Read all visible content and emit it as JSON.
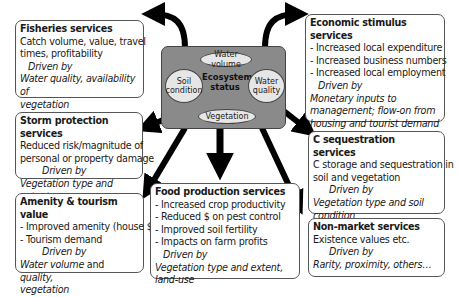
{
  "center": {
    "label_line1": "Ecosystem",
    "label_line2": "status",
    "components": {
      "water_volume": "Water volume",
      "soil_line1": "Soil",
      "soil_line2": "condition",
      "water_quality_line1": "Water",
      "water_quality_line2": "quality",
      "vegetation": "Vegetation"
    },
    "fill_color": "#8a8a8a",
    "ellipse_color": "#e6e6e6"
  },
  "services": {
    "fisheries": {
      "title": "Fisheries services",
      "lines": [
        "Catch volume, value, travel",
        "times, profitability"
      ],
      "driven_by": "Driven by",
      "drivers": [
        "Water quality, availability of",
        "vegetation"
      ]
    },
    "storm": {
      "title": "Storm protection services",
      "lines": [
        "Reduced risk/magnitude of",
        "personal or property damage"
      ],
      "driven_by": "Driven by",
      "drivers": [
        "Vegetation type and extent"
      ]
    },
    "amenity": {
      "title": "Amenity & tourism value",
      "lines": [
        "- Improved amenity (house $)",
        "- Tourism demand"
      ],
      "driven_by": "Driven by",
      "drivers_a": "Water volume",
      "drivers_and": " and ",
      "drivers_b": "quality,",
      "drivers_line2": "vegetation"
    },
    "food": {
      "title": "Food production services",
      "lines": [
        "- Increased crop productivity",
        "- Reduced $ on pest control",
        "- Improved soil fertility",
        "- Impacts on farm profits"
      ],
      "driven_by": "Driven by",
      "drivers": [
        "Vegetation type and extent, land-use"
      ]
    },
    "economic": {
      "title": "Economic stimulus services",
      "lines": [
        "- Increased local expenditure",
        "- Increased business numbers",
        "- Increased local employment"
      ],
      "driven_by": "Driven by",
      "drivers": [
        "Monetary inputs to",
        "management; flow-on from",
        "housing and tourist demand"
      ]
    },
    "carbon": {
      "title": "C sequestration services",
      "lines": [
        "C storage and sequestration in",
        "soil and vegetation"
      ],
      "driven_by": "Driven by",
      "drivers": [
        "Vegetation type and soil",
        "condition"
      ]
    },
    "nonmarket": {
      "title": "Non-market services",
      "lines": [
        "Existence values etc."
      ],
      "driven_by": "Driven by",
      "drivers": [
        "Rarity, proximity, others…"
      ]
    }
  },
  "arrows": [
    {
      "from": "Ecosystem status",
      "to": "Fisheries services"
    },
    {
      "from": "Ecosystem status",
      "to": "Economic stimulus services"
    },
    {
      "from": "Ecosystem status",
      "to": "Storm protection services"
    },
    {
      "from": "Ecosystem status",
      "to": "C sequestration services"
    },
    {
      "from": "Ecosystem status",
      "to": "Amenity & tourism value"
    },
    {
      "from": "Ecosystem status",
      "to": "Food production services"
    },
    {
      "from": "Ecosystem status",
      "to": "Non-market services"
    }
  ]
}
